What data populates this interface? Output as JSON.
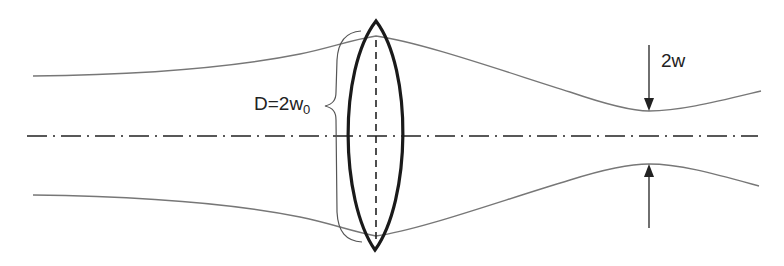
{
  "diagram": {
    "labels": {
      "aperture_label": "D=2w",
      "aperture_subscript": "0",
      "waist_label": "2w"
    },
    "elements": [
      {
        "name": "optical-axis",
        "style": "dash-dot"
      },
      {
        "name": "converging-lens",
        "style": "biconvex, bold outline"
      },
      {
        "name": "lens-plane",
        "style": "dashed vertical"
      },
      {
        "name": "beam-envelope-upper",
        "style": "thin gray curve"
      },
      {
        "name": "beam-envelope-lower",
        "style": "thin gray curve"
      },
      {
        "name": "aperture-brace",
        "style": "curly brace"
      },
      {
        "name": "waist-arrow-top",
        "direction": "down"
      },
      {
        "name": "waist-arrow-bottom",
        "direction": "up"
      }
    ],
    "colors": {
      "beam": "#777777",
      "lens": "#1a1a1a",
      "axis": "#222222",
      "text": "#222222",
      "background": "#ffffff"
    }
  }
}
